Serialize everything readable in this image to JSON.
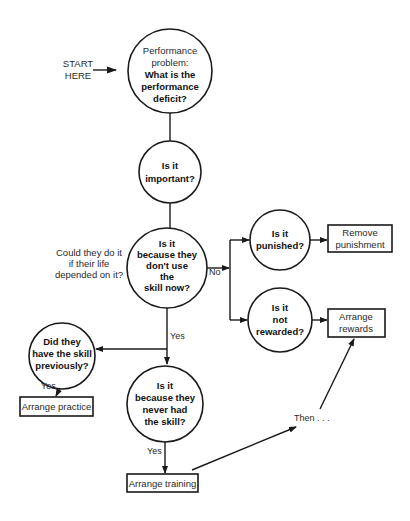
{
  "diagram": {
    "start_label": [
      "START",
      "HERE"
    ],
    "nodes": {
      "deficit": {
        "regular_lines": [
          "Performance",
          "problem:"
        ],
        "bold_lines": [
          "What is the",
          "performance",
          "deficit?"
        ]
      },
      "important": {
        "bold_lines": [
          "Is it",
          "important?"
        ]
      },
      "dont_use": {
        "bold_lines": [
          "Is it",
          "because they",
          "don't use",
          "the",
          "skill now?"
        ]
      },
      "punished": {
        "bold_lines": [
          "Is it",
          "punished?"
        ]
      },
      "not_rewarded": {
        "bold_lines": [
          "Is it",
          "not",
          "rewarded?"
        ]
      },
      "had_previously": {
        "bold_lines": [
          "Did they",
          "have the skill",
          "previously?"
        ]
      },
      "never_had": {
        "bold_lines": [
          "Is it",
          "because they",
          "never had",
          "the skill?"
        ]
      }
    },
    "actions": {
      "remove_punishment": [
        "Remove",
        "punishment"
      ],
      "arrange_rewards": [
        "Arrange",
        "rewards"
      ],
      "arrange_practice": [
        "Arrange practice"
      ],
      "arrange_training": [
        "Arrange training"
      ]
    },
    "side_note": [
      "Could they do it",
      "if their life",
      "depended on it?"
    ],
    "edge_labels": {
      "no": "No",
      "yes_down": "Yes",
      "yes_previously": "Yes",
      "yes_training": "Yes",
      "then": "Then . . ."
    }
  },
  "colors": {
    "ink": "#1a1a1a",
    "background": "#ffffff"
  }
}
